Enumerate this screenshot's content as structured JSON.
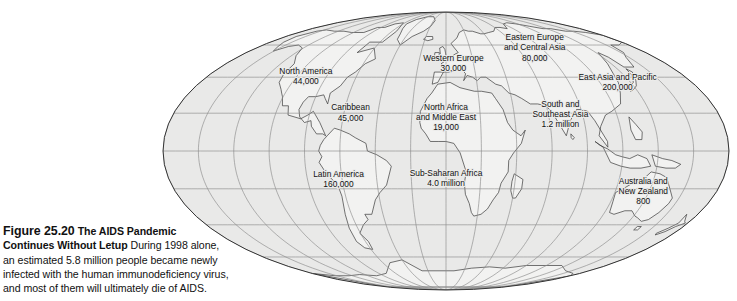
{
  "figure": {
    "number_label": "Figure 25.20",
    "title": "The AIDS Pandemic Continues Without Letup",
    "title_line1": "The AIDS Pandemic",
    "title_line2": "Continues Without Letup",
    "caption_line1_rest": "During 1998 alone,",
    "caption_line2": "an estimated 5.8 million people became newly",
    "caption_line3": "infected with the human immunodeficiency virus,",
    "caption_line4": "and most of them will ultimately die of AIDS."
  },
  "map": {
    "projection": "mollweide-ellipse",
    "ocean_color": "#e9e9e8",
    "land_color": "#f2f2f1",
    "graticule_color": "#8b8b8b",
    "outline_color": "#333333",
    "coast_color": "#3a3a3a",
    "meridian_count": 17,
    "parallel_count": 7
  },
  "chart_data": {
    "type": "map",
    "title": "The AIDS Pandemic Continues Without Letup",
    "unit": "new HIV infections during 1998",
    "total": "5.8 million",
    "regions": [
      {
        "id": "north-america",
        "name": "North America",
        "name_line1": "North America",
        "name_line2": "",
        "value_label": "44,000",
        "value": 44000,
        "x": 0.255,
        "y": 0.245
      },
      {
        "id": "caribbean",
        "name": "Caribbean",
        "name_line1": "Caribbean",
        "name_line2": "",
        "value_label": "45,000",
        "value": 45000,
        "x": 0.333,
        "y": 0.37
      },
      {
        "id": "latin-america",
        "name": "Latin America",
        "name_line1": "Latin America",
        "name_line2": "",
        "value_label": "160,000",
        "value": 160000,
        "x": 0.312,
        "y": 0.6
      },
      {
        "id": "western-europe",
        "name": "Western Europe",
        "name_line1": "Western Europe",
        "name_line2": "",
        "value_label": "30,000",
        "value": 30000,
        "x": 0.513,
        "y": 0.2
      },
      {
        "id": "eastern-europe-central-asia",
        "name": "Eastern Europe and Central Asia",
        "name_line1": "Eastern Europe",
        "name_line2": "and Central Asia",
        "value_label": "80,000",
        "value": 80000,
        "x": 0.655,
        "y": 0.145
      },
      {
        "id": "north-africa-middle-east",
        "name": "North Africa and Middle East",
        "name_line1": "North Africa",
        "name_line2": "and Middle East",
        "value_label": "19,000",
        "value": 19000,
        "x": 0.5,
        "y": 0.385
      },
      {
        "id": "sub-saharan-africa",
        "name": "Sub-Saharan Africa",
        "name_line1": "Sub-Saharan Africa",
        "name_line2": "",
        "value_label": "4.0 million",
        "value": 4000000,
        "x": 0.5,
        "y": 0.595
      },
      {
        "id": "east-asia-pacific",
        "name": "East Asia and Pacific",
        "name_line1": "East Asia and Pacific",
        "name_line2": "",
        "value_label": "200,000",
        "value": 200000,
        "x": 0.8,
        "y": 0.265
      },
      {
        "id": "south-southeast-asia",
        "name": "South and Southeast Asia",
        "name_line1": "South and",
        "name_line2": "Southeast Asia",
        "value_label": "1.2 million",
        "value": 1200000,
        "x": 0.7,
        "y": 0.375
      },
      {
        "id": "australia-new-zealand",
        "name": "Australia and New Zealand",
        "name_line1": "Australia and",
        "name_line2": "New Zealand",
        "value_label": "800",
        "value": 800,
        "x": 0.845,
        "y": 0.64
      }
    ]
  }
}
